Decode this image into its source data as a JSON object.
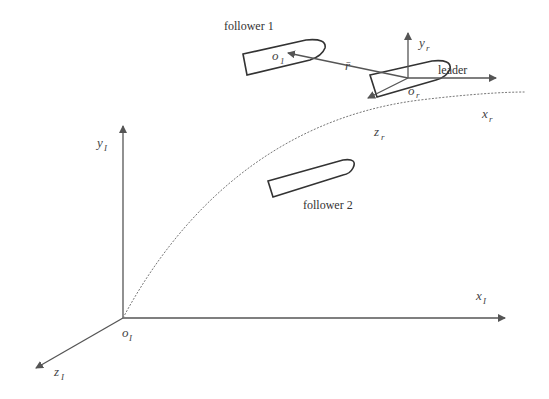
{
  "diagram": {
    "labels": {
      "follower1": "follower 1",
      "follower2": "follower 2",
      "leader": "leader"
    },
    "symbols": {
      "o1": {
        "base": "o",
        "sub": "1"
      },
      "or": {
        "base": "o",
        "sub": "r"
      },
      "r_vec": "r̄",
      "yr": {
        "base": "y",
        "sub": "r"
      },
      "xr": {
        "base": "x",
        "sub": "r"
      },
      "zr": {
        "base": "z",
        "sub": "r"
      },
      "yI": {
        "base": "y",
        "sub": "I"
      },
      "xI": {
        "base": "x",
        "sub": "I"
      },
      "zI": {
        "base": "z",
        "sub": "I"
      },
      "oI": {
        "base": "o",
        "sub": "I"
      }
    },
    "colors": {
      "line": "#555555",
      "hull": "#333333",
      "trajectory": "#777777"
    }
  }
}
